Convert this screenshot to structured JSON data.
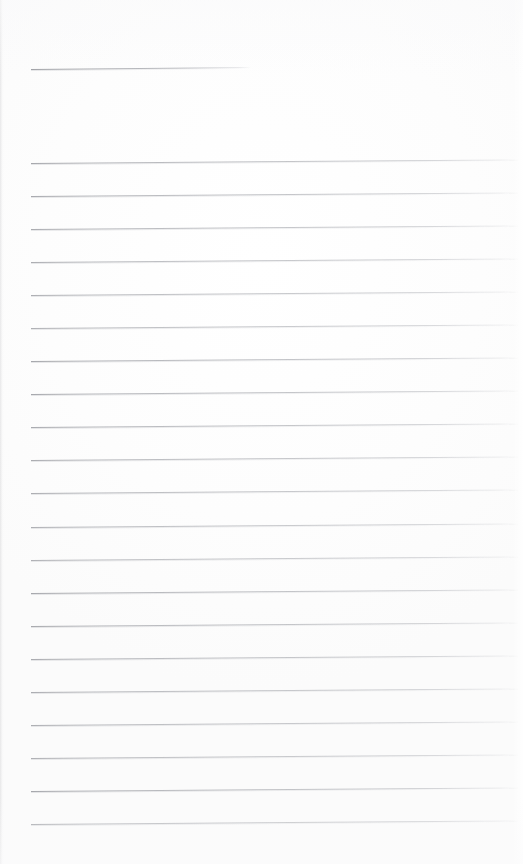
{
  "document": {
    "kind": "scanned-lined-notebook-page",
    "title": "",
    "page_width": 523,
    "page_height": 864,
    "background_color": "#ffffff",
    "rule_color": "#9a9ca2",
    "content_text": "",
    "is_blank": "true"
  },
  "header_rule": {
    "label": "",
    "x": 31,
    "y": 69,
    "width": 220,
    "tilt_deg": -0.55
  },
  "body_rules": {
    "count": 21,
    "left_x": 31,
    "right_x": 519,
    "first_y": 163,
    "spacing": 33.05,
    "tilt_deg": -0.42,
    "lines": [
      {
        "index": 1,
        "y": 163
      },
      {
        "index": 2,
        "y": 196
      },
      {
        "index": 3,
        "y": 229
      },
      {
        "index": 4,
        "y": 262
      },
      {
        "index": 5,
        "y": 295
      },
      {
        "index": 6,
        "y": 328
      },
      {
        "index": 7,
        "y": 361
      },
      {
        "index": 8,
        "y": 394
      },
      {
        "index": 9,
        "y": 427
      },
      {
        "index": 10,
        "y": 460
      },
      {
        "index": 11,
        "y": 493
      },
      {
        "index": 12,
        "y": 527
      },
      {
        "index": 13,
        "y": 560
      },
      {
        "index": 14,
        "y": 593
      },
      {
        "index": 15,
        "y": 626
      },
      {
        "index": 16,
        "y": 659
      },
      {
        "index": 17,
        "y": 692
      },
      {
        "index": 18,
        "y": 725
      },
      {
        "index": 19,
        "y": 758
      },
      {
        "index": 20,
        "y": 791
      },
      {
        "index": 21,
        "y": 824
      }
    ]
  },
  "margins": {
    "top_blank_height": 69,
    "bottom_blank_height": 40,
    "left_margin": 31,
    "right_margin": 4
  }
}
